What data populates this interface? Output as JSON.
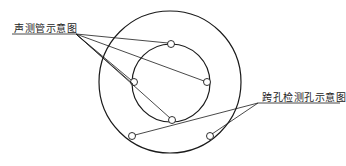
{
  "diagram": {
    "labels": {
      "sonic_tube": "声测管示意图",
      "crosshole": "跨孔检测孔示意图"
    },
    "outer_circle": {
      "cx": 170,
      "cy": 82,
      "r": 71
    },
    "inner_circle": {
      "cx": 171,
      "cy": 83,
      "r": 39
    },
    "sonic_tubes": [
      {
        "cx": 171,
        "cy": 44
      },
      {
        "cx": 207,
        "cy": 82
      },
      {
        "cx": 134,
        "cy": 82
      },
      {
        "cx": 172,
        "cy": 120
      }
    ],
    "crosshole_holes": [
      {
        "cx": 132,
        "cy": 136
      },
      {
        "cx": 210,
        "cy": 136
      }
    ],
    "leader_origin_tube": {
      "x": 76,
      "y": 34
    },
    "leader_origin_hole": {
      "x": 258,
      "y": 103
    },
    "caption_visible": false,
    "colors": {
      "stroke": "#1a1a1a",
      "text": "#222222"
    }
  }
}
